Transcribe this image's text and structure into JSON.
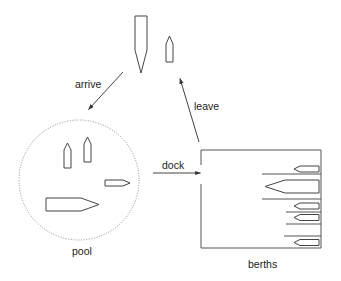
{
  "diagram": {
    "title": "",
    "colors": {
      "line": "#444444",
      "pool_outline": "#8a8a8a",
      "text": "#222222",
      "background": "#ffffff"
    },
    "nodes": {
      "incoming": {
        "label": "",
        "ships": 2
      },
      "pool": {
        "label": "pool",
        "ships": 4
      },
      "berths": {
        "label": "berths",
        "berth_count": 6,
        "occupied": 5
      }
    },
    "edges": {
      "arrive": {
        "label": "arrive",
        "from": "incoming",
        "to": "pool"
      },
      "dock": {
        "label": "dock",
        "from": "pool",
        "to": "berths"
      },
      "leave": {
        "label": "leave",
        "from": "berths",
        "to": "incoming"
      }
    }
  }
}
